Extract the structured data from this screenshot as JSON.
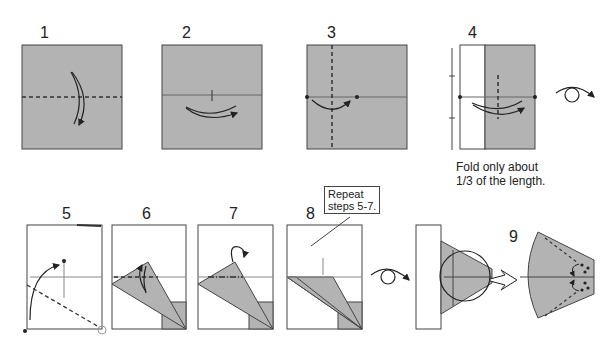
{
  "colors": {
    "paper_gray": "#b3b3b3",
    "paper_white": "#ffffff",
    "line": "#333333",
    "thin_line": "#777777"
  },
  "steps": [
    {
      "number": "1"
    },
    {
      "number": "2"
    },
    {
      "number": "3"
    },
    {
      "number": "4",
      "note_line1": "Fold only about",
      "note_line2": "1/3 of the length."
    },
    {
      "number": "5"
    },
    {
      "number": "6"
    },
    {
      "number": "7"
    },
    {
      "number": "8",
      "callout_line1": "Repeat",
      "callout_line2": "steps 5-7."
    },
    {
      "number": "9"
    }
  ],
  "symbols": {
    "turn_over": "turn-over-icon",
    "valley_fold": "valley-fold-line",
    "mountain_fold": "mountain-fold-line",
    "fold_arrow": "fold-arrow-icon",
    "zoom_in": "zoom-circle"
  }
}
